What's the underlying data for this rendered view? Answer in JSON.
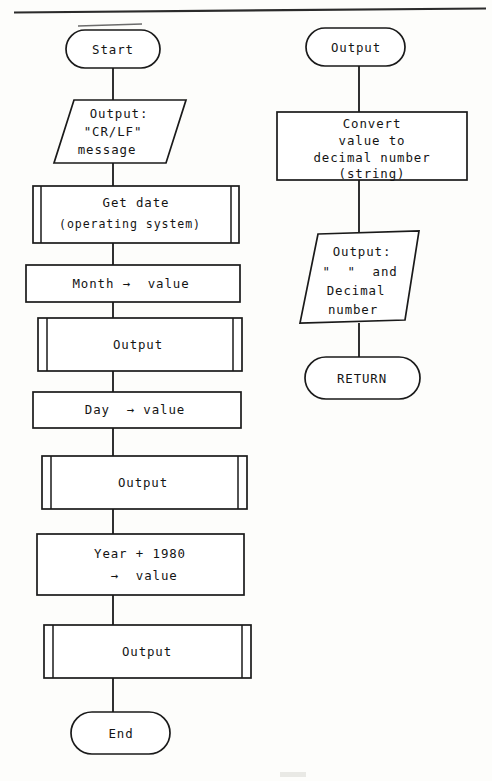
{
  "diagram": {
    "background_color": "#fdfdfb",
    "ink_color": "#1a1a1a",
    "page_rule_color": "#2b2b2b"
  },
  "left_column": {
    "nodes": [
      {
        "id": "start",
        "kind": "terminator",
        "lines": [
          "Start"
        ]
      },
      {
        "id": "out_crlf",
        "kind": "parallelogram",
        "lines": [
          "Output:",
          "\"CR/LF\"",
          "message"
        ]
      },
      {
        "id": "get_date",
        "kind": "predefined-process",
        "lines": [
          "Get date",
          "(operating system)"
        ]
      },
      {
        "id": "month_value",
        "kind": "process",
        "lines": [
          "Month →  value"
        ]
      },
      {
        "id": "output_1",
        "kind": "predefined-process",
        "lines": [
          "Output"
        ]
      },
      {
        "id": "day_value",
        "kind": "process",
        "lines": [
          "Day  → value"
        ]
      },
      {
        "id": "output_2",
        "kind": "predefined-process",
        "lines": [
          "Output"
        ]
      },
      {
        "id": "year_value",
        "kind": "process",
        "lines": [
          "Year + 1980",
          " →  value"
        ]
      },
      {
        "id": "output_3",
        "kind": "predefined-process",
        "lines": [
          "Output"
        ]
      },
      {
        "id": "end",
        "kind": "terminator",
        "lines": [
          "End"
        ]
      }
    ]
  },
  "right_column": {
    "nodes": [
      {
        "id": "sub_output",
        "kind": "terminator",
        "lines": [
          "Output"
        ]
      },
      {
        "id": "convert",
        "kind": "process",
        "lines": [
          "Convert",
          "value to",
          "decimal number",
          "(string)"
        ]
      },
      {
        "id": "out_decimal",
        "kind": "parallelogram",
        "lines": [
          "Output:",
          "\"  \"  and",
          "Decimal",
          "number"
        ]
      },
      {
        "id": "return",
        "kind": "terminator",
        "lines": [
          "RETURN"
        ]
      }
    ]
  },
  "labels": {
    "start": "Start",
    "out_crlf_l1": "Output:",
    "out_crlf_l2": "\"CR/LF\"",
    "out_crlf_l3": "message",
    "get_date_l1": "Get date",
    "get_date_l2": "(operating system)",
    "month_value": "Month →  value",
    "output_1": "Output",
    "day_value": "Day  → value",
    "output_2": "Output",
    "year_value_l1": "Year + 1980",
    "year_value_l2": " →  value",
    "output_3": "Output",
    "end": "End",
    "sub_output": "Output",
    "convert_l1": "Convert",
    "convert_l2": "value to",
    "convert_l3": "decimal number",
    "convert_l4": "(string)",
    "out_decimal_l1": "Output:",
    "out_decimal_l2": "\"  \"  and",
    "out_decimal_l3": "Decimal",
    "out_decimal_l4": "number",
    "return": "RETURN"
  }
}
